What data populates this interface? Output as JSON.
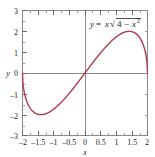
{
  "chart_data": {
    "type": "line",
    "title": "",
    "subtitle": "",
    "xlabel": "x",
    "ylabel": "y",
    "xlim": [
      -2,
      2
    ],
    "ylim": [
      -3,
      3
    ],
    "grid": false,
    "legend": "none",
    "annotation": "y = x √(4 − x²)",
    "annotation_parts": {
      "lhs": "y",
      "equals": "=",
      "coef": "x",
      "radical": "√",
      "radicand_a": "4",
      "minus": "−",
      "radicand_b": "x",
      "radicand_exp": "2"
    },
    "xticks": [
      -2,
      -1.5,
      -1,
      -0.5,
      0,
      0.5,
      1,
      1.5,
      2
    ],
    "xtick_labels": [
      "–2",
      "–1.5",
      "–1",
      "–0.5",
      "0",
      "0.5",
      "1",
      "1.5",
      "2"
    ],
    "yticks": [
      -3,
      -2,
      -1,
      0,
      1,
      2,
      3
    ],
    "ytick_labels": [
      "–3",
      "–2",
      "–1",
      "0",
      "1",
      "2",
      "3"
    ],
    "minor_ticks": true,
    "series": [
      {
        "name": "y = x sqrt(4 - x^2)",
        "color": "#b03a4a",
        "linewidth": 1.4,
        "x": [
          -2,
          -1.95,
          -1.9,
          -1.85,
          -1.8,
          -1.75,
          -1.7,
          -1.6,
          -1.5,
          -1.4142,
          -1.3,
          -1.2,
          -1.1,
          -1,
          -0.9,
          -0.8,
          -0.7,
          -0.6,
          -0.5,
          -0.4,
          -0.3,
          -0.2,
          -0.1,
          0,
          0.1,
          0.2,
          0.3,
          0.4,
          0.5,
          0.6,
          0.7,
          0.8,
          0.9,
          1,
          1.1,
          1.2,
          1.3,
          1.4142,
          1.5,
          1.6,
          1.7,
          1.75,
          1.8,
          1.85,
          1.9,
          1.95,
          2
        ],
        "y": [
          0,
          -0.8661,
          -1.2086,
          -1.4452,
          -1.6248,
          -1.7628,
          -1.8673,
          -2.0,
          -2.0463,
          -2.0,
          -1.9747,
          -1.9199,
          -1.8358,
          -1.7321,
          -1.6148,
          -1.4875,
          -1.3519,
          -1.2093,
          -1.0607,
          -0.9066,
          -0.748,
          -0.5857,
          -0.4205,
          0,
          0.4205,
          0.5857,
          0.748,
          0.9066,
          1.0607,
          1.2093,
          1.3519,
          1.4875,
          1.6148,
          1.7321,
          1.8358,
          1.9199,
          1.9747,
          2.0,
          2.0463,
          2.0,
          1.8673,
          1.7628,
          1.6248,
          1.4452,
          1.2086,
          0.8661,
          0
        ]
      }
    ],
    "peak_points": [
      {
        "x": -1.4142,
        "y": -2.0
      },
      {
        "x": 1.4142,
        "y": 2.0
      }
    ],
    "frame_color": "#8a8a8a",
    "axis_color": "#8a8a8a",
    "background": "#ffffff"
  }
}
